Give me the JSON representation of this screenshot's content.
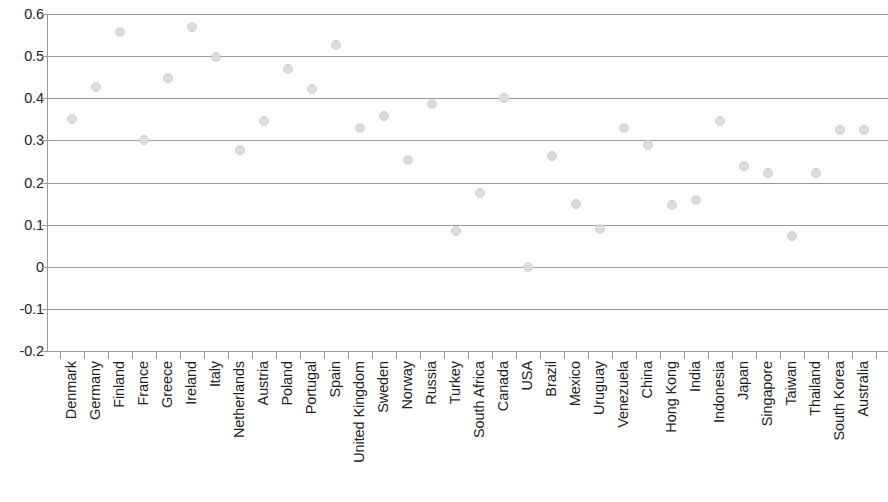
{
  "chart_data": {
    "type": "scatter",
    "title": "",
    "xlabel": "",
    "ylabel": "",
    "ylim": [
      -0.2,
      0.6
    ],
    "y_ticks": [
      "0.6",
      "0.5",
      "0.4",
      "0.3",
      "0.2",
      "0.1",
      "0",
      "-0.1",
      "-0.2"
    ],
    "y_tick_values": [
      0.6,
      0.5,
      0.4,
      0.3,
      0.2,
      0.1,
      0,
      -0.1,
      -0.2
    ],
    "grid": true,
    "legend": "none",
    "marker": "circle",
    "marker_color": "#dcdcdc",
    "axis_color": "#9a9a9a",
    "text_color": "#231f20",
    "categories": [
      "Denmark",
      "Germany",
      "Finland",
      "France",
      "Greece",
      "Ireland",
      "Italy",
      "Netherlands",
      "Austria",
      "Poland",
      "Portugal",
      "Spain",
      "United Kingdom",
      "Sweden",
      "Norway",
      "Russia",
      "Turkey",
      "South Africa",
      "Canada",
      "USA",
      "Brazil",
      "Mexico",
      "Uruguay",
      "Venezuela",
      "China",
      "Hong Kong",
      "India",
      "Indonesia",
      "Japan",
      "Singapore",
      "Taiwan",
      "Thailand",
      "South Korea",
      "Australia"
    ],
    "values": [
      0.35,
      0.427,
      0.558,
      0.3,
      0.449,
      0.568,
      0.497,
      0.277,
      0.347,
      0.47,
      0.421,
      0.526,
      0.33,
      0.358,
      0.253,
      0.386,
      0.086,
      0.176,
      0.4,
      0.0,
      0.262,
      0.15,
      0.09,
      0.33,
      0.288,
      0.146,
      0.158,
      0.347,
      0.238,
      0.223,
      0.074,
      0.222,
      0.325,
      0.325
    ],
    "series_name": ""
  }
}
